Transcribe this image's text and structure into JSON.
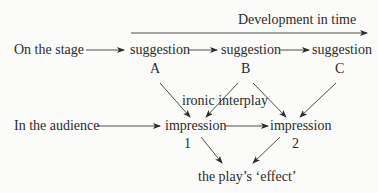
{
  "diagram": {
    "title": "Development in time",
    "rows": {
      "stage": {
        "label": "On the stage",
        "nodes": [
          {
            "text": "suggestion",
            "tag": "A"
          },
          {
            "text": "suggestion",
            "tag": "B"
          },
          {
            "text": "suggestion",
            "tag": "C"
          }
        ]
      },
      "audience": {
        "label": "In the audience",
        "nodes": [
          {
            "text": "impression",
            "tag": "1"
          },
          {
            "text": "impression",
            "tag": "2"
          }
        ]
      }
    },
    "interplay_label": "ironic interplay",
    "result": "the play’s ‘effect’",
    "edges": [
      {
        "from": "On the stage",
        "to": "suggestion A"
      },
      {
        "from": "suggestion A",
        "to": "suggestion B"
      },
      {
        "from": "suggestion B",
        "to": "suggestion C"
      },
      {
        "from": "In the audience",
        "to": "impression 1"
      },
      {
        "from": "impression 1",
        "to": "impression 2"
      },
      {
        "from": "suggestion A",
        "to": "impression 1"
      },
      {
        "from": "suggestion B",
        "to": "impression 1"
      },
      {
        "from": "suggestion B",
        "to": "impression 2"
      },
      {
        "from": "suggestion C",
        "to": "impression 2"
      },
      {
        "from": "impression 1",
        "to": "the play’s ‘effect’"
      },
      {
        "from": "impression 2",
        "to": "the play’s ‘effect’"
      }
    ],
    "colors": {
      "ink": "#2b2b2b",
      "paper": "#fbfbfa"
    }
  }
}
